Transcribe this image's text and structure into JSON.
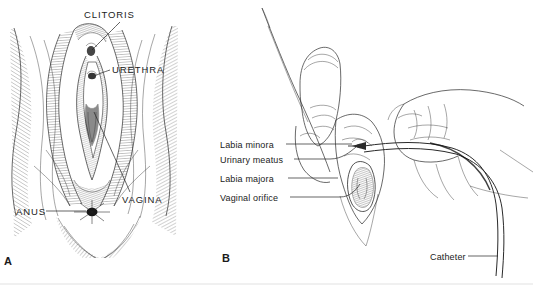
{
  "figure": {
    "type": "medical-illustration",
    "title_visible": false,
    "background_color": "#ffffff",
    "ink_color": "#2a2a2a",
    "text_color": "#1b1b1b",
    "width": 533,
    "height": 290
  },
  "panels": [
    {
      "letter": "A",
      "subject": "female-perineum-anatomy",
      "style": "pen-and-ink cross-hatched engraving",
      "labels": [
        {
          "id": "clitoris",
          "text": "CLITORIS",
          "case": "uppercase"
        },
        {
          "id": "urethra",
          "text": "URETHRA",
          "case": "uppercase"
        },
        {
          "id": "vagina",
          "text": "VAGINA",
          "case": "uppercase"
        },
        {
          "id": "anus",
          "text": "ANUS",
          "case": "uppercase"
        }
      ]
    },
    {
      "letter": "B",
      "subject": "urinary-catheter-insertion-with-gloved-hands",
      "style": "line drawing",
      "labels": [
        {
          "id": "labia-minora",
          "text": "Labia minora",
          "case": "sentence"
        },
        {
          "id": "urinary-meatus",
          "text": "Urinary meatus",
          "case": "sentence"
        },
        {
          "id": "labia-majora",
          "text": "Labia majora",
          "case": "sentence"
        },
        {
          "id": "vaginal-orifice",
          "text": "Vaginal orifice",
          "case": "sentence"
        },
        {
          "id": "catheter",
          "text": "Catheter",
          "case": "sentence"
        }
      ]
    }
  ]
}
